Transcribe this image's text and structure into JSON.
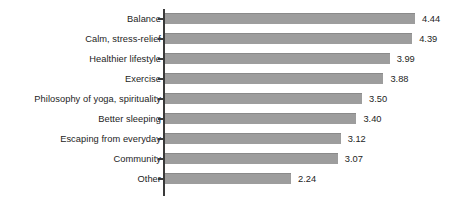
{
  "chart_data": {
    "type": "bar",
    "orientation": "horizontal",
    "title": "",
    "subtitle": "",
    "xlabel": "",
    "ylabel": "",
    "grid": false,
    "legend": null,
    "xlim": [
      0,
      4.44
    ],
    "axis_position": "left",
    "value_label_format": "0.00",
    "categories": [
      "Balance",
      "Calm, stress-relief",
      "Healthier lifestyle",
      "Exercise",
      "Philosophy of yoga, spirituality",
      "Better sleeping",
      "Escaping from everyday",
      "Community",
      "Other"
    ],
    "values": [
      4.44,
      4.39,
      3.99,
      3.88,
      3.5,
      3.4,
      3.12,
      3.07,
      2.24
    ],
    "value_labels": [
      "4.44",
      "4.39",
      "3.99",
      "3.88",
      "3.50",
      "3.40",
      "3.12",
      "3.07",
      "2.24"
    ],
    "colors": {
      "bar": "#9d9d9d",
      "bar_edge": "#8a8a8a",
      "axis": "#3a3a3a",
      "text": "#1d1d1d",
      "background": "#ffffff"
    }
  }
}
